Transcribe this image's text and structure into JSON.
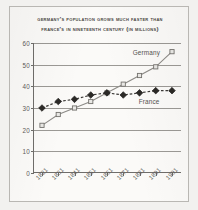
{
  "title": {
    "line1": "Germany's Population Grows Much Faster than",
    "line2": "France's in Nineteenth Century (in millions)"
  },
  "annotations": {
    "germany": "Germany",
    "france": "France"
  },
  "colors": {
    "paper": "#fbfaf8",
    "border": "#b9b7b3",
    "axis": "#6f6d6a",
    "gridline": "#9b9995",
    "text": "#55534f",
    "germany_line": "#8d8b87",
    "germany_marker_fill": "#e9e8e5",
    "france_line": "#3a3835",
    "france_marker_fill": "#2b2926"
  },
  "chart_data": {
    "type": "line",
    "title": "Germany's Population Grows Much Faster than France's in Nineteenth Century (in millions)",
    "xlabel": "",
    "ylabel": "",
    "ylim": [
      0,
      60
    ],
    "yticks": [
      0,
      10,
      20,
      30,
      40,
      50,
      60
    ],
    "grid": true,
    "legend": "inline-annotations",
    "categories": [
      "1821",
      "1831",
      "1841",
      "1851",
      "1861",
      "1871",
      "1881",
      "1891",
      "1901"
    ],
    "series": [
      {
        "name": "Germany",
        "marker": "open-square",
        "line_style": "solid",
        "values": [
          22,
          27,
          30,
          33,
          37,
          41,
          45,
          49,
          56
        ]
      },
      {
        "name": "France",
        "marker": "filled-diamond",
        "line_style": "dashed",
        "values": [
          30,
          33,
          34,
          36,
          37,
          36,
          37,
          38,
          38
        ]
      }
    ]
  }
}
